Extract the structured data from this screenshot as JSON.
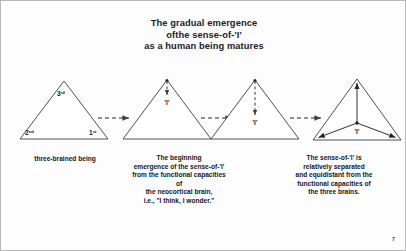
{
  "slide": {
    "page_number": "7",
    "title_lines": [
      "The gradual emergence",
      "ofthe sense-of-'I'",
      "as a human being matures"
    ],
    "title_line_1": "The gradual emergence",
    "title_line_2": "ofthe sense-of-'I'",
    "title_line_3": "as a human being matures"
  },
  "diagram": {
    "type": "progression",
    "stage_count": 4,
    "connector": "dashed-arrow-right",
    "connector_count": 3,
    "stages": [
      {
        "id": "stage-1",
        "shape": "triangle",
        "vertex_labels": {
          "apex": "3rd",
          "bottom_left": "2nd",
          "bottom_right": "1st"
        },
        "marker": "none",
        "i_label": ""
      },
      {
        "id": "stage-2",
        "shape": "triangle",
        "vertex_labels": {},
        "marker": "dashed-arrow-down-short",
        "i_label": "'I'"
      },
      {
        "id": "stage-3",
        "shape": "triangle",
        "vertex_labels": {},
        "marker": "dashed-arrow-down-long",
        "i_label": "'I'"
      },
      {
        "id": "stage-4",
        "shape": "triangle",
        "vertex_labels": {},
        "marker": "three-solid-arrows-from-center",
        "i_label": "'I'"
      }
    ]
  },
  "captions": {
    "one": {
      "lines": [
        "three-brained being"
      ],
      "line_1": "three-brained being"
    },
    "two": {
      "line_1": "The beginning",
      "line_2": "emergence of the sense-of-'I'",
      "line_3": "from the functional capacities",
      "line_4": "of",
      "line_5": "the neocortical brain,",
      "line_6": "i.e., \"I think, I wonder.\""
    },
    "three": {
      "line_1": "The sense-of-'I' is",
      "line_2": "relatively separated",
      "line_3": "and equidistant from the",
      "line_4": "functional capacities of",
      "line_5": "the three brains."
    }
  },
  "colors": {
    "background": "#fdfdfd",
    "border": "#b8b8b8",
    "ink": "#16161f",
    "line": "#3b3b4a"
  }
}
